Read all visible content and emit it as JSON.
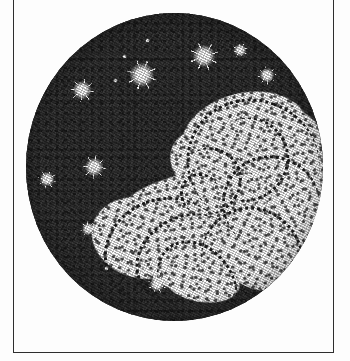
{
  "plate": {
    "title": "Telescopic view of a nebula",
    "medium": "stipple engraving",
    "caption": "",
    "frame": {
      "border_color": "#2e2e2e",
      "paper_color": "#fdfdfd",
      "left": 13,
      "top": -6,
      "width": 321,
      "height": 359,
      "top_edge_cropped": true
    },
    "field_of_view": {
      "shape": "circle",
      "center_x": 175,
      "center_y": 167,
      "diameter": 297,
      "sky_color": "#2b2b2b",
      "nebula_color": "#fbfbfb",
      "stipple_color": "#1d1d1d"
    }
  },
  "nebula_blobs": [
    {
      "name": "upper-right-lobe",
      "x": 52,
      "y": 26,
      "w": 44,
      "h": 30,
      "rot": -14
    },
    {
      "name": "upper-arm-east",
      "x": 68,
      "y": 30,
      "w": 34,
      "h": 26,
      "rot": 18
    },
    {
      "name": "right-bright-mass",
      "x": 70,
      "y": 40,
      "w": 33,
      "h": 34,
      "rot": -8
    },
    {
      "name": "core-upper",
      "x": 48,
      "y": 38,
      "w": 30,
      "h": 22,
      "rot": 22
    },
    {
      "name": "central-band",
      "x": 30,
      "y": 52,
      "w": 52,
      "h": 20,
      "rot": -12
    },
    {
      "name": "lower-left-lobe",
      "x": 22,
      "y": 60,
      "w": 34,
      "h": 26,
      "rot": 16
    },
    {
      "name": "lower-central-mass",
      "x": 38,
      "y": 66,
      "w": 38,
      "h": 24,
      "rot": -6
    },
    {
      "name": "lower-right-arm",
      "x": 64,
      "y": 62,
      "w": 32,
      "h": 28,
      "rot": 26
    },
    {
      "name": "east-streak",
      "x": 80,
      "y": 52,
      "w": 24,
      "h": 18,
      "rot": -30
    },
    {
      "name": "south-tail",
      "x": 46,
      "y": 80,
      "w": 26,
      "h": 14,
      "rot": 10
    }
  ],
  "spiral_arcs": [
    {
      "name": "arc-outer-ne",
      "x": 54,
      "y": 28,
      "w": 44,
      "h": 40,
      "rot": 20,
      "reverse": false
    },
    {
      "name": "arc-inner-ne",
      "x": 60,
      "y": 34,
      "w": 28,
      "h": 26,
      "rot": -40,
      "reverse": true
    },
    {
      "name": "arc-core",
      "x": 50,
      "y": 44,
      "w": 22,
      "h": 20,
      "rot": 120,
      "reverse": false
    },
    {
      "name": "arc-mid-east",
      "x": 66,
      "y": 46,
      "w": 32,
      "h": 30,
      "rot": 200,
      "reverse": true
    },
    {
      "name": "arc-lower-sw",
      "x": 26,
      "y": 60,
      "w": 40,
      "h": 34,
      "rot": -20,
      "reverse": false
    },
    {
      "name": "arc-lower-mid",
      "x": 36,
      "y": 66,
      "w": 34,
      "h": 26,
      "rot": 150,
      "reverse": true
    },
    {
      "name": "arc-lower-se",
      "x": 58,
      "y": 64,
      "w": 36,
      "h": 32,
      "rot": 65,
      "reverse": false
    },
    {
      "name": "arc-south",
      "x": 42,
      "y": 76,
      "w": 30,
      "h": 22,
      "rot": 230,
      "reverse": true
    },
    {
      "name": "arc-knot",
      "x": 52,
      "y": 52,
      "w": 12,
      "h": 12,
      "rot": 0,
      "reverse": false
    }
  ],
  "stars": [
    {
      "name": "star-nw-bright",
      "x": 19,
      "y": 25,
      "size": 9,
      "class": "big",
      "rot": 12
    },
    {
      "name": "star-n-large",
      "x": 39,
      "y": 20,
      "size": 12,
      "class": "big",
      "rot": -22
    },
    {
      "name": "star-n-small",
      "x": 33,
      "y": 14,
      "size": 3,
      "class": "pt",
      "rot": 0
    },
    {
      "name": "star-n-dot",
      "x": 41,
      "y": 9,
      "size": 3,
      "class": "pt",
      "rot": 0
    },
    {
      "name": "star-ne-bright",
      "x": 60,
      "y": 14,
      "size": 11,
      "class": "big",
      "rot": 30
    },
    {
      "name": "star-ne-upper",
      "x": 72,
      "y": 12,
      "size": 6,
      "class": "big",
      "rot": -10
    },
    {
      "name": "star-ne-east",
      "x": 81,
      "y": 20,
      "size": 7,
      "class": "big",
      "rot": 44
    },
    {
      "name": "star-w-mid",
      "x": 23,
      "y": 50,
      "size": 9,
      "class": "big",
      "rot": -35
    },
    {
      "name": "star-w-edge",
      "x": 7,
      "y": 54,
      "size": 7,
      "class": "big",
      "rot": 18
    },
    {
      "name": "star-sw-mid",
      "x": 21,
      "y": 70,
      "size": 6,
      "class": "big",
      "rot": -48
    },
    {
      "name": "star-s-blob",
      "x": 44,
      "y": 88,
      "size": 7,
      "class": "big",
      "rot": 26
    },
    {
      "name": "star-s-dot-1",
      "x": 27,
      "y": 83,
      "size": 3,
      "class": "pt",
      "rot": 0
    },
    {
      "name": "star-s-dot-2",
      "x": 34,
      "y": 83,
      "size": 3,
      "class": "pt",
      "rot": 0
    },
    {
      "name": "star-s-dot-3",
      "x": 52,
      "y": 91,
      "size": 3,
      "class": "pt",
      "rot": 0
    },
    {
      "name": "star-s-dot-4",
      "x": 59,
      "y": 88,
      "size": 3,
      "class": "pt",
      "rot": 0
    },
    {
      "name": "star-se-dot-1",
      "x": 76,
      "y": 80,
      "size": 3,
      "class": "pt",
      "rot": 0
    },
    {
      "name": "star-se-dot-2",
      "x": 83,
      "y": 80,
      "size": 3,
      "class": "pt",
      "rot": 0
    },
    {
      "name": "star-se-dot-3",
      "x": 80,
      "y": 85,
      "size": 3,
      "class": "pt",
      "rot": 0
    },
    {
      "name": "star-nw-dot",
      "x": 30,
      "y": 22,
      "size": 3,
      "class": "pt",
      "rot": 0
    }
  ]
}
